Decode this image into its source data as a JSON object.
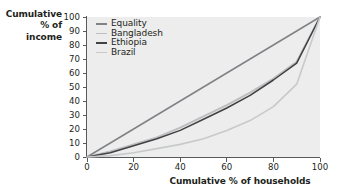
{
  "chart_data": {
    "type": "line",
    "title": "",
    "xlabel": "Cumulative % of households",
    "ylabel": "Cumulative\n% of\nincome",
    "xlim": [
      0,
      100
    ],
    "ylim": [
      0,
      100
    ],
    "xticks": [
      0,
      20,
      40,
      60,
      80,
      100
    ],
    "yticks": [
      0,
      10,
      20,
      30,
      40,
      50,
      60,
      70,
      80,
      90,
      100
    ],
    "grid": false,
    "legend_position": "top-left",
    "x": [
      0,
      10,
      20,
      30,
      40,
      50,
      60,
      70,
      80,
      90,
      100
    ],
    "series": [
      {
        "name": "Equality",
        "color": "#808285",
        "width": 1.5,
        "values": [
          0,
          10,
          20,
          30,
          40,
          50,
          60,
          70,
          80,
          90,
          100
        ]
      },
      {
        "name": "Bangladesh",
        "color": "#bcbec0",
        "width": 1.9,
        "values": [
          0,
          4,
          9,
          14,
          21,
          29,
          37,
          46,
          56,
          68,
          100
        ]
      },
      {
        "name": "Ethiopia",
        "color": "#414042",
        "width": 1.5,
        "values": [
          0,
          3,
          8,
          13,
          19,
          27,
          35,
          44,
          55,
          67,
          100
        ]
      },
      {
        "name": "Brazil",
        "color": "#c7c9cb",
        "width": 1.6,
        "values": [
          0,
          1,
          3,
          6,
          9,
          13,
          19,
          26,
          36,
          52,
          100
        ]
      }
    ]
  },
  "axes": {
    "y_title": "Cumulative\n% of\nincome",
    "x_title": "Cumulative % of households",
    "y_tick_labels": [
      "100",
      "90",
      "80",
      "70",
      "60",
      "50",
      "40",
      "30",
      "20",
      "10",
      "0"
    ],
    "x_tick_labels": [
      "0",
      "20",
      "40",
      "60",
      "80",
      "100"
    ]
  },
  "legend": {
    "items": [
      {
        "label": "Equality",
        "color": "#808285"
      },
      {
        "label": "Bangladesh",
        "color": "#bcbec0"
      },
      {
        "label": "Ethiopia",
        "color": "#414042"
      },
      {
        "label": "Brazil",
        "color": "#c7c9cb"
      }
    ]
  },
  "style": {
    "plot_background": "#ededed",
    "page_background": "#ffffff",
    "axis_color": "#58595b",
    "text_color": "#231f20"
  }
}
